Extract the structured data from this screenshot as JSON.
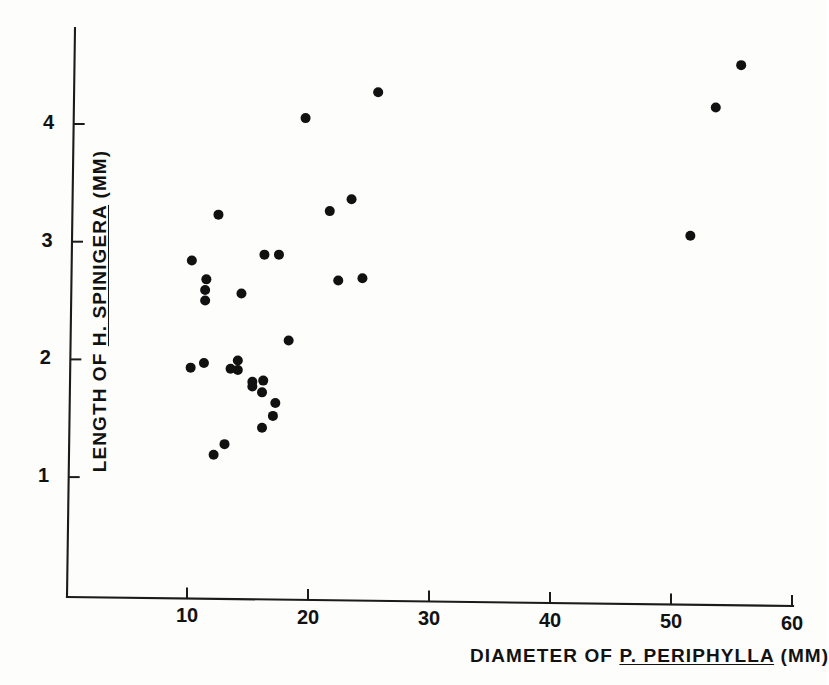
{
  "chart_data": {
    "type": "scatter",
    "title": "",
    "xlabel_parts": {
      "pre": "DIAMETER OF ",
      "emph": "P. PERIPHYLLA",
      "post": " (MM)"
    },
    "ylabel_parts": {
      "pre": "LENGTH OF ",
      "emph": "H. SPINIGERA",
      "post": " (MM)"
    },
    "xlabel": "DIAMETER OF P. PERIPHYLLA (MM)",
    "ylabel": "LENGTH OF H. SPINIGERA (MM)",
    "xticks": [
      10,
      20,
      30,
      40,
      50,
      60
    ],
    "xticklabels": [
      "10",
      "20",
      "30",
      "40",
      "50",
      "60"
    ],
    "yticks": [
      1,
      2,
      3,
      4
    ],
    "yticklabels": [
      "1",
      "2",
      "3",
      "4"
    ],
    "xlim": [
      4.5,
      61.5
    ],
    "ylim": [
      0.0,
      4.85
    ],
    "grid": false,
    "legend": false,
    "marker": "filled-circle",
    "marker_color": "#111111",
    "points": [
      {
        "x": 10.4,
        "y": 2.84
      },
      {
        "x": 11.6,
        "y": 2.68
      },
      {
        "x": 11.5,
        "y": 2.59
      },
      {
        "x": 11.5,
        "y": 2.5
      },
      {
        "x": 12.6,
        "y": 3.23
      },
      {
        "x": 14.5,
        "y": 2.56
      },
      {
        "x": 16.4,
        "y": 2.89
      },
      {
        "x": 17.6,
        "y": 2.89
      },
      {
        "x": 19.8,
        "y": 4.05
      },
      {
        "x": 25.8,
        "y": 4.27
      },
      {
        "x": 21.8,
        "y": 3.26
      },
      {
        "x": 23.6,
        "y": 3.36
      },
      {
        "x": 22.5,
        "y": 2.67
      },
      {
        "x": 24.5,
        "y": 2.69
      },
      {
        "x": 18.4,
        "y": 2.16
      },
      {
        "x": 10.3,
        "y": 1.93
      },
      {
        "x": 11.4,
        "y": 1.97
      },
      {
        "x": 13.6,
        "y": 1.92
      },
      {
        "x": 14.2,
        "y": 1.99
      },
      {
        "x": 14.2,
        "y": 1.91
      },
      {
        "x": 15.4,
        "y": 1.81
      },
      {
        "x": 15.4,
        "y": 1.77
      },
      {
        "x": 16.3,
        "y": 1.82
      },
      {
        "x": 16.2,
        "y": 1.72
      },
      {
        "x": 17.3,
        "y": 1.63
      },
      {
        "x": 17.1,
        "y": 1.52
      },
      {
        "x": 16.2,
        "y": 1.42
      },
      {
        "x": 13.1,
        "y": 1.28
      },
      {
        "x": 12.2,
        "y": 1.19
      },
      {
        "x": 51.6,
        "y": 3.05
      },
      {
        "x": 53.7,
        "y": 4.14
      },
      {
        "x": 55.8,
        "y": 4.5
      }
    ]
  },
  "figure": {
    "background_color": "#fdfdfc",
    "axis_color": "#1b1b1b",
    "point_color": "#111111",
    "point_radius_px": 5
  }
}
